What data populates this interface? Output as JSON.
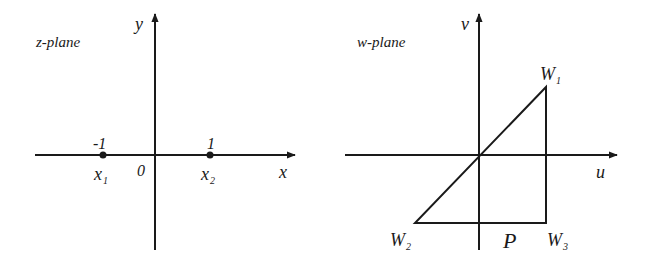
{
  "z_plane": {
    "title": "z-plane",
    "x_axis_label": "x",
    "y_axis_label": "y",
    "origin_label": "0",
    "points": [
      {
        "name": "x",
        "subscript": "1",
        "value_label": "-1"
      },
      {
        "name": "x",
        "subscript": "2",
        "value_label": "1"
      }
    ]
  },
  "w_plane": {
    "title": "w-plane",
    "u_axis_label": "u",
    "v_axis_label": "v",
    "region_label": "P",
    "vertices": [
      {
        "name": "W",
        "subscript": "1"
      },
      {
        "name": "W",
        "subscript": "2"
      },
      {
        "name": "W",
        "subscript": "3"
      }
    ]
  },
  "colors": {
    "ink": "#1a1a1a",
    "background": "#ffffff"
  }
}
